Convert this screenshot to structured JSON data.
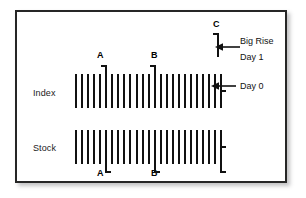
{
  "figure": {
    "type": "ohlc-bar-illustration",
    "background": "#ffffff",
    "frame_color": "#262626",
    "bar_color": "#111111"
  },
  "rows": {
    "index": {
      "label": "Index"
    },
    "stock": {
      "label": "Stock"
    }
  },
  "markers": {
    "a_top": "A",
    "b_top": "B",
    "c_top": "C",
    "a_bottom": "A",
    "b_bottom": "B"
  },
  "annotations": {
    "big_rise_line1": "Big Rise",
    "big_rise_line2": "Day 1",
    "day_zero": "Day 0"
  },
  "chart_data": {
    "type": "bar",
    "title": "",
    "xlabel": "",
    "ylabel": "",
    "series": [
      {
        "name": "Index",
        "bar_count": 25,
        "baseline_top": 62,
        "baseline_bottom": 96,
        "highlighted_indices": [
          5,
          13
        ],
        "highlight_style": "extends-higher-with-upper-left-tick",
        "last_bar_tick": "mid-right",
        "last_bar_label": "Day 0"
      },
      {
        "name": "Stock",
        "bar_count": 25,
        "baseline_top": 118,
        "baseline_bottom": 152,
        "highlighted_indices": [
          5,
          13
        ],
        "highlight_style": "extends-lower-with-lower-right-tick",
        "last_bar_tick": "mid-right",
        "last_bar_label": "Day 0"
      },
      {
        "name": "C",
        "bar_count": 1,
        "description": "Isolated tall bar above the Index row with an upper-left opening tick, annotated Big Rise Day 1"
      }
    ],
    "legend": [],
    "grid": false
  }
}
